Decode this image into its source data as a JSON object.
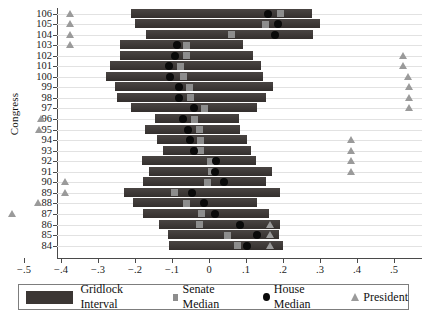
{
  "chart_data": {
    "type": "bar",
    "orientation": "horizontal",
    "title": "",
    "xlabel": "",
    "ylabel": "Congress",
    "xlim": [
      -0.58,
      0.58
    ],
    "ylim_categories_top_to_bottom": [
      106,
      105,
      104,
      103,
      102,
      101,
      100,
      99,
      98,
      97,
      96,
      95,
      94,
      93,
      92,
      91,
      90,
      89,
      88,
      87,
      86,
      85,
      84
    ],
    "grid": true,
    "xticks": [
      -0.5,
      -0.4,
      -0.3,
      -0.2,
      -0.1,
      0,
      0.1,
      0.2,
      0.3,
      0.4,
      0.5
    ],
    "xtick_labels": [
      "−.5",
      "−.4",
      "−.3",
      "−.2",
      "−.1",
      "0",
      ".1",
      ".2",
      ".3",
      ".4",
      ".5"
    ],
    "yticks": [
      106,
      105,
      104,
      103,
      102,
      101,
      100,
      99,
      98,
      97,
      96,
      95,
      94,
      93,
      92,
      91,
      90,
      89,
      88,
      87,
      86,
      85,
      84
    ],
    "legend_position": "bottom",
    "series": [
      {
        "name": "Gridlock Interval",
        "type": "interval-bar",
        "color": "#3b3634"
      },
      {
        "name": "Senate Median",
        "type": "square-marker",
        "color": "#8d8d8d"
      },
      {
        "name": "House Median",
        "type": "circle-marker",
        "color": "#0a0a0a"
      },
      {
        "name": "President",
        "type": "triangle-marker",
        "color": "#9a9a9a"
      }
    ],
    "rows": [
      {
        "congress": 106,
        "interval": [
          -0.211,
          0.279
        ],
        "senate_median": 0.192,
        "house_median": 0.16,
        "president": -0.373
      },
      {
        "congress": 105,
        "interval": [
          -0.2,
          0.3
        ],
        "senate_median": 0.154,
        "house_median": 0.186,
        "president": -0.373
      },
      {
        "congress": 104,
        "interval": [
          -0.17,
          0.281
        ],
        "senate_median": 0.06,
        "house_median": 0.178,
        "president": -0.373
      },
      {
        "congress": 103,
        "interval": [
          -0.241,
          0.092
        ],
        "senate_median": -0.06,
        "house_median": -0.087,
        "president": -0.373
      },
      {
        "congress": 102,
        "interval": [
          -0.241,
          0.119
        ],
        "senate_median": -0.062,
        "house_median": -0.092,
        "president": 0.527
      },
      {
        "congress": 101,
        "interval": [
          -0.268,
          0.141
        ],
        "senate_median": -0.076,
        "house_median": -0.108,
        "president": 0.527
      },
      {
        "congress": 100,
        "interval": [
          -0.279,
          0.146
        ],
        "senate_median": -0.07,
        "house_median": -0.105,
        "president": 0.538
      },
      {
        "congress": 99,
        "interval": [
          -0.254,
          0.173
        ],
        "senate_median": -0.054,
        "house_median": -0.081,
        "president": 0.543
      },
      {
        "congress": 98,
        "interval": [
          -0.249,
          0.154
        ],
        "senate_median": -0.049,
        "house_median": -0.081,
        "president": 0.543
      },
      {
        "congress": 97,
        "interval": [
          -0.211,
          0.13
        ],
        "senate_median": -0.011,
        "house_median": -0.041,
        "president": 0.543
      },
      {
        "congress": 96,
        "interval": [
          -0.146,
          0.081
        ],
        "senate_median": -0.038,
        "house_median": -0.07,
        "president": -0.454
      },
      {
        "congress": 95,
        "interval": [
          -0.173,
          0.084
        ],
        "senate_median": -0.027,
        "house_median": -0.057,
        "president": -0.459
      },
      {
        "congress": 94,
        "interval": [
          -0.141,
          0.103
        ],
        "senate_median": -0.024,
        "house_median": -0.051,
        "president": 0.384
      },
      {
        "congress": 93,
        "interval": [
          -0.124,
          0.114
        ],
        "senate_median": -0.022,
        "house_median": -0.041,
        "president": 0.384
      },
      {
        "congress": 92,
        "interval": [
          -0.181,
          0.127
        ],
        "senate_median": 0.003,
        "house_median": 0.019,
        "president": 0.384
      },
      {
        "congress": 91,
        "interval": [
          -0.162,
          0.17
        ],
        "senate_median": 0.008,
        "house_median": 0.016,
        "president": 0.384
      },
      {
        "congress": 90,
        "interval": [
          -0.178,
          0.154
        ],
        "senate_median": -0.005,
        "house_median": 0.041,
        "president": -0.389
      },
      {
        "congress": 89,
        "interval": [
          -0.23,
          0.192
        ],
        "senate_median": -0.092,
        "house_median": -0.046,
        "president": -0.389
      },
      {
        "congress": 88,
        "interval": [
          -0.205,
          0.13
        ],
        "senate_median": -0.062,
        "house_median": -0.014,
        "president": -0.462
      },
      {
        "congress": 87,
        "interval": [
          -0.178,
          0.162
        ],
        "senate_median": -0.019,
        "house_median": 0.016,
        "president": -0.53
      },
      {
        "congress": 86,
        "interval": [
          -0.135,
          0.192
        ],
        "senate_median": -0.027,
        "house_median": 0.084,
        "president": 0.165
      },
      {
        "congress": 85,
        "interval": [
          -0.111,
          0.189
        ],
        "senate_median": 0.051,
        "house_median": 0.13,
        "president": 0.165
      },
      {
        "congress": 84,
        "interval": [
          -0.108,
          0.2
        ],
        "senate_median": 0.078,
        "house_median": 0.103,
        "president": 0.165
      }
    ]
  },
  "axes": {
    "y_title": "Congress"
  },
  "legend": {
    "items": [
      {
        "label": "Gridlock Interval",
        "icon": "bar-swatch-icon"
      },
      {
        "label": "Senate Median",
        "icon": "square-marker-icon"
      },
      {
        "label": "House Median",
        "icon": "circle-marker-icon"
      },
      {
        "label": "President",
        "icon": "triangle-marker-icon"
      }
    ]
  }
}
